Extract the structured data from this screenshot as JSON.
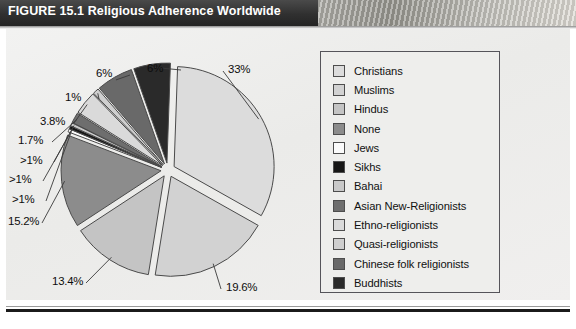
{
  "figure": {
    "number": "FIGURE 15.1",
    "title": "Religious Adherence Worldwide"
  },
  "chart_data": {
    "type": "pie",
    "title": "Religious Adherence Worldwide",
    "exploded": true,
    "legend_position": "right",
    "grid": false,
    "categories": [
      "Christians",
      "Muslims",
      "Hindus",
      "None",
      "Jews",
      "Sikhs",
      "Bahai",
      "Asian New-Religionists",
      "Ethno-religionists",
      "Quasi-religionists",
      "Chinese folk religionists",
      "Buddhists"
    ],
    "values": [
      33,
      19.6,
      13.4,
      15.2,
      0.5,
      0.5,
      0.5,
      1.7,
      3.8,
      1,
      6,
      6
    ],
    "value_labels": [
      "33%",
      "19.6%",
      "13.4%",
      "15.2%",
      ">1%",
      ">1%",
      ">1%",
      "1.7%",
      "3.8%",
      "1%",
      "6%",
      "6%"
    ],
    "slice_colors": [
      "#dcdcdc",
      "#d2d2d2",
      "#c4c4c4",
      "#8c8c8c",
      "#fbfbfb",
      "#161616",
      "#c9c9c9",
      "#6e6e6e",
      "#dadada",
      "#cfcfcf",
      "#696969",
      "#2a2a2a"
    ],
    "xlabel": "",
    "ylabel": ""
  },
  "legend": {
    "items": [
      {
        "label": "Christians",
        "color": "#dcdcdc"
      },
      {
        "label": "Muslims",
        "color": "#d2d2d2"
      },
      {
        "label": "Hindus",
        "color": "#c4c4c4"
      },
      {
        "label": "None",
        "color": "#8c8c8c"
      },
      {
        "label": "Jews",
        "color": "#fbfbfb"
      },
      {
        "label": "Sikhs",
        "color": "#161616"
      },
      {
        "label": "Bahai",
        "color": "#c9c9c9"
      },
      {
        "label": "Asian New-Religionists",
        "color": "#6e6e6e"
      },
      {
        "label": "Ethno-religionists",
        "color": "#dadada"
      },
      {
        "label": "Quasi-religionists",
        "color": "#cfcfcf"
      },
      {
        "label": "Chinese folk religionists",
        "color": "#696969"
      },
      {
        "label": "Buddhists",
        "color": "#2a2a2a"
      }
    ]
  },
  "callouts": [
    {
      "name": "pct-christians",
      "text": "33%",
      "x": 228,
      "y": 63
    },
    {
      "name": "pct-muslims",
      "text": "19.6%",
      "x": 226,
      "y": 281
    },
    {
      "name": "pct-hindus",
      "text": "13.4%",
      "x": 52,
      "y": 275
    },
    {
      "name": "pct-none",
      "text": "15.2%",
      "x": 8,
      "y": 215
    },
    {
      "name": "pct-jews",
      "text": ">1%",
      "x": 12,
      "y": 193
    },
    {
      "name": "pct-sikhs",
      "text": ">1%",
      "x": 9,
      "y": 173
    },
    {
      "name": "pct-bahai",
      "text": ">1%",
      "x": 20,
      "y": 154
    },
    {
      "name": "pct-asian-new",
      "text": "1.7%",
      "x": 18,
      "y": 134
    },
    {
      "name": "pct-ethno",
      "text": "3.8%",
      "x": 40,
      "y": 115
    },
    {
      "name": "pct-quasi",
      "text": "1%",
      "x": 65,
      "y": 91
    },
    {
      "name": "pct-chinese-folk",
      "text": "6%",
      "x": 96,
      "y": 67
    },
    {
      "name": "pct-buddhists",
      "text": "6%",
      "x": 147,
      "y": 62
    }
  ]
}
